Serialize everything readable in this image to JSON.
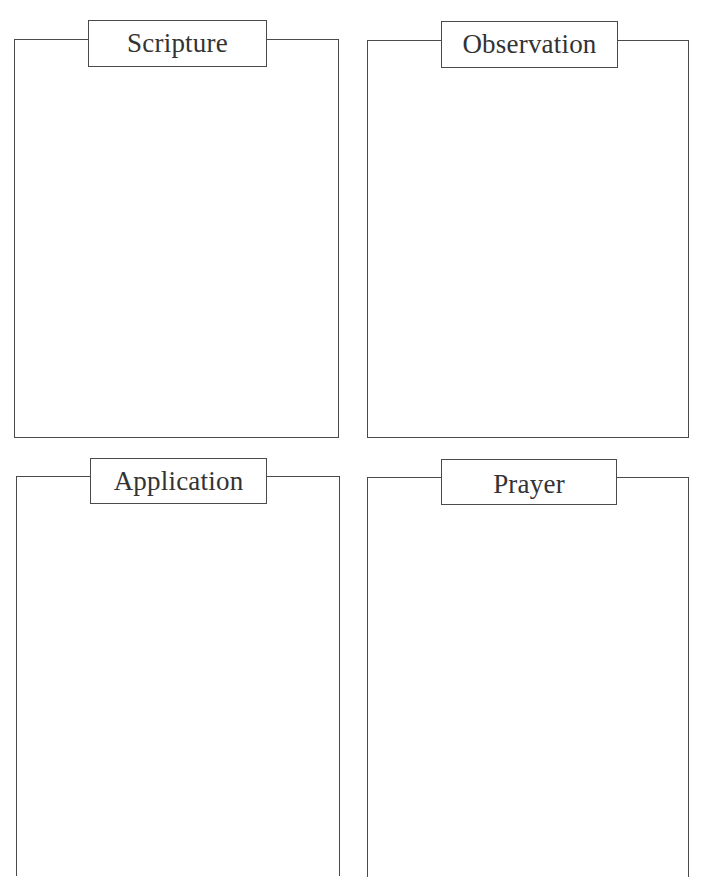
{
  "sections": [
    {
      "id": "scripture",
      "label": "Scripture"
    },
    {
      "id": "observation",
      "label": "Observation"
    },
    {
      "id": "application",
      "label": "Application"
    },
    {
      "id": "prayer",
      "label": "Prayer"
    }
  ],
  "colors": {
    "line": "#4a4a4a",
    "text": "#333333",
    "background": "#ffffff"
  }
}
